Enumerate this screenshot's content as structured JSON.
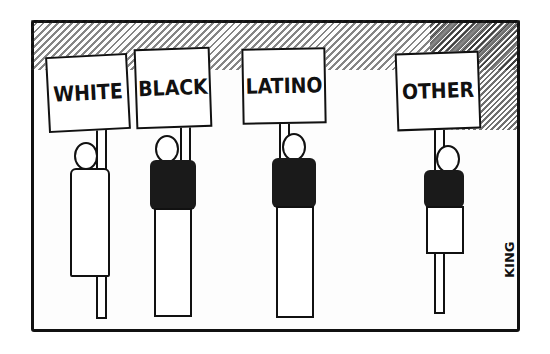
{
  "cartoon": {
    "description": "Pen-and-ink cartoon of four people each holding a protest-style sign",
    "signs": [
      {
        "label": "WHITE"
      },
      {
        "label": "BLACK"
      },
      {
        "label": "LATINO"
      },
      {
        "label": "OTHER"
      }
    ],
    "signature": "KING"
  }
}
